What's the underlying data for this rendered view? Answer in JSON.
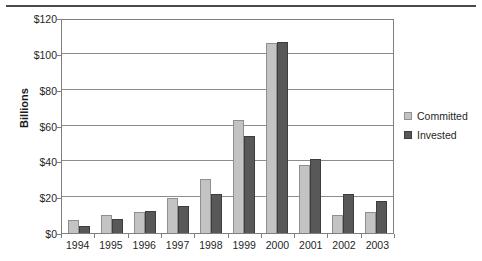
{
  "chart_data": {
    "type": "bar",
    "title": "",
    "xlabel": "",
    "ylabel": "Billions",
    "ylim": [
      0,
      120
    ],
    "ytick_labels": [
      "$0",
      "$20",
      "$40",
      "$60",
      "$80",
      "$100",
      "$120"
    ],
    "ytick_values": [
      0,
      20,
      40,
      60,
      80,
      100,
      120
    ],
    "grid": true,
    "legend_position": "right",
    "categories": [
      "1994",
      "1995",
      "1996",
      "1997",
      "1998",
      "1999",
      "2000",
      "2001",
      "2002",
      "2003"
    ],
    "series": [
      {
        "name": "Committed",
        "color": "#c3c3c3",
        "values": [
          7.5,
          10,
          12,
          19.5,
          30,
          63,
          106,
          38,
          10,
          12
        ]
      },
      {
        "name": "Invested",
        "color": "#585858",
        "values": [
          4,
          8,
          12.5,
          15,
          22,
          54,
          106.5,
          41.5,
          22,
          18
        ]
      }
    ]
  },
  "legend": {
    "items": [
      {
        "label": "Committed",
        "swatch": "legend-swatch-committed"
      },
      {
        "label": "Invested",
        "swatch": "legend-swatch-invested"
      }
    ]
  }
}
